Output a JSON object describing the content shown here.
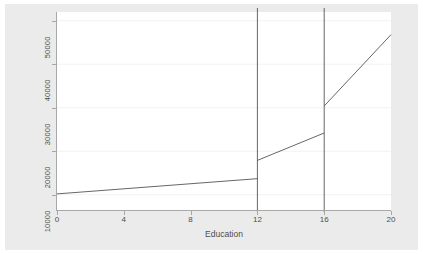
{
  "figure": {
    "background_color": "#ebebeb",
    "plot_background_color": "#ffffff",
    "axis_color": "#a8a8a8",
    "line_color": "#555555",
    "grid_color": "#f2f2f2"
  },
  "chart_data": {
    "type": "line",
    "title": "",
    "xlabel": "Education",
    "ylabel": "Adjusted means",
    "xlim": [
      0,
      20
    ],
    "ylim": [
      6500,
      52000
    ],
    "xticks": [
      0,
      4,
      8,
      12,
      16,
      20
    ],
    "xticklabels": [
      "0",
      "4",
      "8",
      "12",
      "16",
      "20"
    ],
    "yticks": [
      10000,
      20000,
      30000,
      40000,
      50000
    ],
    "yticklabels": [
      "10000",
      "20000",
      "30000",
      "40000",
      "50000"
    ],
    "grid": true,
    "grid_axis": "y",
    "legend": false,
    "legend_position": "none",
    "series": [
      {
        "name": "Segment 0-12",
        "x": [
          0,
          12
        ],
        "values": [
          10200,
          13700
        ]
      },
      {
        "name": "Segment 12-16",
        "x": [
          12,
          16
        ],
        "values": [
          17900,
          24200
        ]
      },
      {
        "name": "Segment 16-20",
        "x": [
          16,
          20
        ],
        "values": [
          30400,
          46800
        ]
      }
    ],
    "vertical_reference_lines": [
      {
        "x": 12,
        "label": "12"
      },
      {
        "x": 16,
        "label": "16"
      }
    ],
    "jumps": [
      {
        "x": 12,
        "from": 13700,
        "to": 17900,
        "size": 4200
      },
      {
        "x": 16,
        "from": 24200,
        "to": 30400,
        "size": 6200
      }
    ]
  }
}
